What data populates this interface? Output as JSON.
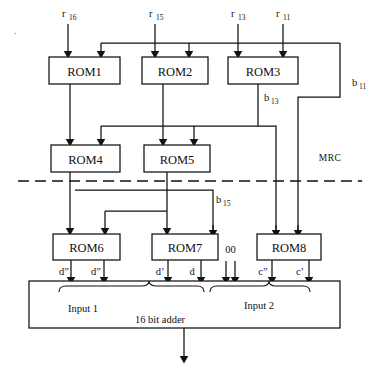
{
  "diagram": {
    "colors": {
      "line": "#111111",
      "text": "#111111",
      "background": "#ffffff"
    },
    "top_inputs": [
      {
        "name": "r16",
        "base": "r",
        "sub": "16"
      },
      {
        "name": "r15",
        "base": "r",
        "sub": "15"
      },
      {
        "name": "r13",
        "base": "r",
        "sub": "13"
      },
      {
        "name": "r11",
        "base": "r",
        "sub": "11"
      }
    ],
    "rom_blocks": [
      {
        "label": "ROM1"
      },
      {
        "label": "ROM2"
      },
      {
        "label": "ROM3"
      },
      {
        "label": "ROM4"
      },
      {
        "label": "ROM5"
      },
      {
        "label": "ROM6"
      },
      {
        "label": "ROM7"
      },
      {
        "label": "ROM8"
      }
    ],
    "bus_labels": [
      {
        "name": "b13",
        "base": "b",
        "sub": "13"
      },
      {
        "name": "b11",
        "base": "b",
        "sub": "11"
      },
      {
        "name": "b15",
        "base": "b",
        "sub": "15"
      }
    ],
    "region_label": "MRC",
    "constant_label": "00",
    "operand_labels": [
      {
        "name": "d-double-prime-left",
        "text": "d”"
      },
      {
        "name": "d-double-prime-right",
        "text": "d”"
      },
      {
        "name": "d-prime",
        "text": "d’"
      },
      {
        "name": "d",
        "text": "d"
      },
      {
        "name": "c-double-prime",
        "text": "c”"
      },
      {
        "name": "c-prime",
        "text": "c’"
      }
    ],
    "adder": {
      "label": "16 bit adder",
      "input1": "Input 1",
      "input2": "Input 2"
    },
    "stray_mark": "."
  }
}
